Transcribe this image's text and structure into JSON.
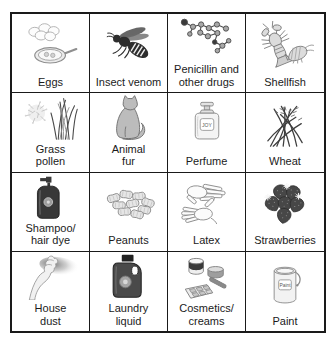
{
  "colors": {
    "background": "#ffffff",
    "border": "#1a1a1a",
    "label_text": "#1b1b1b",
    "dark_fill": "#3a3a3a",
    "light_fill": "#e6e6e6"
  },
  "grid": {
    "rows": 4,
    "cols": 4,
    "cells": [
      {
        "label": "Eggs",
        "icon": "eggs-icon"
      },
      {
        "label": "Insect venom",
        "icon": "wasp-icon"
      },
      {
        "label": "Penicillin and\nother drugs",
        "icon": "molecule-icon"
      },
      {
        "label": "Shellfish",
        "icon": "shellfish-icon"
      },
      {
        "label": "Grass\npollen",
        "icon": "grass-pollen-icon"
      },
      {
        "label": "Animal\nfur",
        "icon": "cat-icon"
      },
      {
        "label": "Perfume",
        "icon": "perfume-bottle-icon"
      },
      {
        "label": "Wheat",
        "icon": "wheat-icon"
      },
      {
        "label": "Shampoo/\nhair dye",
        "icon": "shampoo-bottle-icon"
      },
      {
        "label": "Peanuts",
        "icon": "peanuts-icon"
      },
      {
        "label": "Latex",
        "icon": "latex-gloves-icon"
      },
      {
        "label": "Strawberries",
        "icon": "strawberries-icon"
      },
      {
        "label": "House\ndust",
        "icon": "house-dust-icon"
      },
      {
        "label": "Laundry\nliquid",
        "icon": "laundry-jug-icon"
      },
      {
        "label": "Cosmetics/\ncreams",
        "icon": "cosmetics-icon"
      },
      {
        "label": "Paint",
        "icon": "paint-can-icon"
      }
    ]
  },
  "icon_text": {
    "perfume_bottle": "JOY",
    "paint_can": "Paint"
  }
}
